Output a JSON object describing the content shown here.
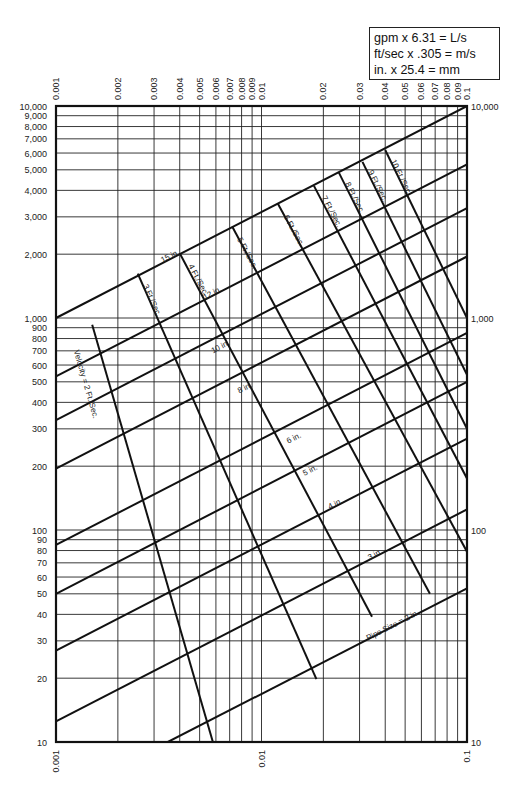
{
  "chart_data": {
    "type": "line",
    "title": "",
    "xlabel": "",
    "ylabel": "",
    "xscale": "log",
    "yscale": "log",
    "xlim": [
      0.001,
      0.1
    ],
    "ylim": [
      10,
      10000
    ],
    "grid": true,
    "x_ticks_top": [
      "0.001",
      "0.002",
      "0.003",
      "0.004",
      "0.005",
      "0.006",
      "0.007",
      "0.008",
      "0.009",
      "0.01",
      "0.02",
      "0.03",
      "0.04",
      "0.05",
      "0.06",
      "0.07",
      "0.08",
      "0.09",
      "0.1"
    ],
    "x_tick_values": [
      0.001,
      0.002,
      0.003,
      0.004,
      0.005,
      0.006,
      0.007,
      0.008,
      0.009,
      0.01,
      0.02,
      0.03,
      0.04,
      0.05,
      0.06,
      0.07,
      0.08,
      0.09,
      0.1
    ],
    "x_ticks_bottom": [
      "0.001",
      "0.01",
      "0.1"
    ],
    "x_tick_bottom_values": [
      0.001,
      0.01,
      0.1
    ],
    "y_ticks_left": [
      "10",
      "20",
      "30",
      "40",
      "50",
      "60",
      "70",
      "80",
      "90",
      "100",
      "200",
      "300",
      "400",
      "500",
      "600",
      "700",
      "800",
      "900",
      "1,000",
      "2,000",
      "3,000",
      "4,000",
      "5,000",
      "6,000",
      "7,000",
      "8,000",
      "9,000",
      "10,000"
    ],
    "y_tick_values": [
      10,
      20,
      30,
      40,
      50,
      60,
      70,
      80,
      90,
      100,
      200,
      300,
      400,
      500,
      600,
      700,
      800,
      900,
      1000,
      2000,
      3000,
      4000,
      5000,
      6000,
      7000,
      8000,
      9000,
      10000
    ],
    "y_ticks_right": [
      "10",
      "100",
      "1,000",
      "10,000"
    ],
    "y_tick_right_values": [
      10,
      100,
      1000,
      10000
    ],
    "pipe_size_series": [
      {
        "name": "15 in.",
        "label": "15 in.",
        "points": [
          [
            0.001,
            1000
          ],
          [
            0.1,
            10000
          ]
        ],
        "label_at": [
          0.0033,
          1820
        ]
      },
      {
        "name": "12 in.",
        "label": "12 in.",
        "points": [
          [
            0.001,
            530
          ],
          [
            0.1,
            5300
          ]
        ],
        "label_at": [
          0.0053,
          1220
        ]
      },
      {
        "name": "10 in.",
        "label": "10 in.",
        "points": [
          [
            0.001,
            330
          ],
          [
            0.1,
            3300
          ]
        ],
        "label_at": [
          0.0058,
          680
        ]
      },
      {
        "name": "8 in.",
        "label": "8 in.",
        "points": [
          [
            0.001,
            195
          ],
          [
            0.1,
            1950
          ]
        ],
        "label_at": [
          0.0078,
          440
        ]
      },
      {
        "name": "6 in.",
        "label": "6 in.",
        "points": [
          [
            0.001,
            85
          ],
          [
            0.1,
            850
          ]
        ],
        "label_at": [
          0.0135,
          255
        ]
      },
      {
        "name": "5 in.",
        "label": "5 in.",
        "points": [
          [
            0.001,
            50
          ],
          [
            0.1,
            500
          ]
        ],
        "label_at": [
          0.0162,
          180
        ]
      },
      {
        "name": "4 in.",
        "label": "4 in.",
        "points": [
          [
            0.001,
            27
          ],
          [
            0.1,
            270
          ]
        ],
        "label_at": [
          0.0215,
          125
        ]
      },
      {
        "name": "3 in.",
        "label": "3 in.",
        "points": [
          [
            0.001,
            12.5
          ],
          [
            0.1,
            125
          ]
        ],
        "label_at": [
          0.0335,
          72
        ]
      },
      {
        "name": "2 in.",
        "label": "Pipe Size = 2 in.",
        "points": [
          [
            0.0035,
            10
          ],
          [
            0.1,
            53
          ]
        ],
        "label_at": [
          0.033,
          30
        ]
      }
    ],
    "velocity_series": [
      {
        "name": "2 Ft./Sec.",
        "label": "Velocity = 2 Ft./Sec.",
        "points": [
          [
            0.0015,
            930
          ],
          [
            0.0058,
            10
          ]
        ],
        "label_at": [
          0.00122,
          700
        ]
      },
      {
        "name": "3 Ft./Sec.",
        "label": "3 Ft./Sec.",
        "points": [
          [
            0.0025,
            1620
          ],
          [
            0.0185,
            19.8
          ]
        ],
        "label_at": [
          0.00265,
          1420
        ]
      },
      {
        "name": "4 Ft./Sec.",
        "label": "4 Ft./Sec.",
        "points": [
          [
            0.004,
            2020
          ],
          [
            0.0345,
            39
          ]
        ],
        "label_at": [
          0.0044,
          1760
        ]
      },
      {
        "name": "5 Ft./Sec.",
        "label": "5 Ft./Sec.",
        "points": [
          [
            0.0072,
            2700
          ],
          [
            0.066,
            50
          ]
        ],
        "label_at": [
          0.0076,
          2350
        ]
      },
      {
        "name": "6 Ft./Sec.",
        "label": "6 Ft./Sec.",
        "points": [
          [
            0.012,
            3470
          ],
          [
            0.1,
            79
          ]
        ],
        "label_at": [
          0.0128,
          3000
        ]
      },
      {
        "name": "7 Ft./Sec.",
        "label": "7 Ft./Sec.",
        "points": [
          [
            0.018,
            4200
          ],
          [
            0.1,
            175
          ]
        ],
        "label_at": [
          0.0196,
          3700
        ]
      },
      {
        "name": "8 Ft./Sec.",
        "label": "8 Ft./Sec.",
        "points": [
          [
            0.0238,
            4850
          ],
          [
            0.1,
            300
          ]
        ],
        "label_at": [
          0.0255,
          4300
        ]
      },
      {
        "name": "9 Ft./Sec.",
        "label": "9 Ft./Sec.",
        "points": [
          [
            0.031,
            5450
          ],
          [
            0.1,
            540
          ]
        ],
        "label_at": [
          0.033,
          4900
        ]
      },
      {
        "name": "10 Ft./Sec.",
        "label": "10 Ft./Sec.",
        "points": [
          [
            0.04,
            6200
          ],
          [
            0.1,
            1000
          ]
        ],
        "label_at": [
          0.0425,
          5500
        ]
      }
    ],
    "annotations": [
      "gpm x 6.31 = L/s",
      "ft/sec x .305 = m/s",
      "in. x 25.4 = mm"
    ]
  },
  "conversion_box": {
    "line1": "gpm x 6.31  = L/s",
    "line2": "ft/sec x .305 = m/s",
    "line3": "in. x 25.4 = mm"
  },
  "colors": {
    "background": "#ffffff",
    "line": "#111111",
    "grid": "#222222",
    "text": "#222222"
  }
}
